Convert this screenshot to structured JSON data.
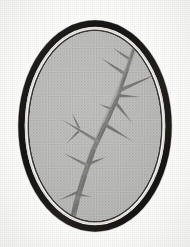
{
  "figure": {
    "kind": "botanical-line-engraving",
    "medium": "halftone print reproduction",
    "frame_shape": "oval",
    "alt_text": "A halftone printed illustration of a spiny twig bearing long straight thorns, enclosed in a heavy dark oval frame on an off-white page."
  },
  "colors": {
    "page_background": "#fdfdfc",
    "frame_outer_dark": "#1c1b19",
    "frame_mid_dark": "#2e2c29",
    "frame_highlight": "#e8e6e1",
    "frame_inner_line": "#34322e",
    "plate_interior": "#bdbdbb",
    "plate_interior_shade": "#aeaeac",
    "branch_dark": "#5d5c59",
    "branch_mid": "#77766f",
    "branch_light": "#93928c"
  },
  "geometry": {
    "canvas_width": 190,
    "canvas_height": 247,
    "oval_center_x": 95,
    "oval_center_y": 126,
    "oval_outer_rx": 76,
    "oval_outer_ry": 105,
    "frame_band_width": 6,
    "inner_rule_inset": 9
  },
  "branch": {
    "description": "main stem running from upper right down to lower left with alternating spines",
    "thorn_count_visible": 14,
    "node_count": 5
  }
}
